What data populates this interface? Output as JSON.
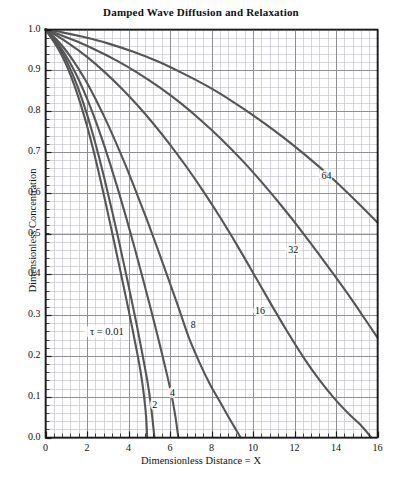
{
  "chart_data": {
    "type": "line",
    "title": "Damped Wave Diffusion and Relaxation",
    "xlabel": "Dimensionless Distance = X",
    "ylabel": "Dimensionless Concentration",
    "xlim": [
      0,
      16
    ],
    "ylim": [
      0,
      1.0
    ],
    "xticks": [
      0,
      2,
      4,
      6,
      8,
      10,
      12,
      14,
      16
    ],
    "xticklabels": [
      "0",
      "2",
      "4",
      "6",
      "8",
      "10",
      "12",
      "14",
      "16"
    ],
    "yticks": [
      0.0,
      0.1,
      0.2,
      0.3,
      0.4,
      0.5,
      0.6,
      0.7,
      0.8,
      0.9,
      1.0
    ],
    "yticklabels": [
      "0.0",
      "0.1",
      "0.2",
      "0.3",
      "0.4",
      "0.5",
      "0.6",
      "0.7",
      "0.8",
      "0.9",
      "1.0"
    ],
    "grid": true,
    "grid_minor_x_step": 0.4,
    "grid_minor_y_step": 0.02,
    "legend_position": "inline-curve-labels",
    "curve_color": "#555555",
    "grid_color": "#8f8f96",
    "minor_grid_color": "#c3c3cb",
    "frame_color": "#1a1a1a",
    "series": [
      {
        "name": "tau = 0.01",
        "label": "τ = 0.01",
        "label_x": 1.9,
        "label_y": 0.255,
        "points": [
          [
            0.0,
            1.0
          ],
          [
            0.2,
            0.985
          ],
          [
            0.5,
            0.962
          ],
          [
            0.8,
            0.935
          ],
          [
            1.1,
            0.902
          ],
          [
            1.4,
            0.862
          ],
          [
            1.7,
            0.816
          ],
          [
            2.0,
            0.764
          ],
          [
            2.3,
            0.706
          ],
          [
            2.6,
            0.642
          ],
          [
            2.9,
            0.575
          ],
          [
            3.2,
            0.505
          ],
          [
            3.5,
            0.434
          ],
          [
            3.8,
            0.362
          ],
          [
            4.1,
            0.289
          ],
          [
            4.4,
            0.212
          ],
          [
            4.6,
            0.156
          ],
          [
            4.75,
            0.1
          ],
          [
            4.85,
            0.05
          ],
          [
            4.9,
            0.0
          ]
        ]
      },
      {
        "name": "tau = 2",
        "label": "2",
        "label_x": 5.05,
        "label_y": 0.075,
        "points": [
          [
            0.0,
            1.0
          ],
          [
            0.2,
            0.987
          ],
          [
            0.5,
            0.967
          ],
          [
            0.8,
            0.943
          ],
          [
            1.1,
            0.914
          ],
          [
            1.4,
            0.879
          ],
          [
            1.7,
            0.838
          ],
          [
            2.0,
            0.792
          ],
          [
            2.3,
            0.74
          ],
          [
            2.6,
            0.683
          ],
          [
            2.9,
            0.622
          ],
          [
            3.2,
            0.557
          ],
          [
            3.5,
            0.49
          ],
          [
            3.8,
            0.42
          ],
          [
            4.1,
            0.349
          ],
          [
            4.4,
            0.275
          ],
          [
            4.7,
            0.196
          ],
          [
            4.95,
            0.126
          ],
          [
            5.1,
            0.07
          ],
          [
            5.25,
            0.0
          ]
        ]
      },
      {
        "name": "tau = 4",
        "label": "4",
        "label_x": 5.9,
        "label_y": 0.105,
        "points": [
          [
            0.0,
            1.0
          ],
          [
            0.3,
            0.984
          ],
          [
            0.7,
            0.958
          ],
          [
            1.1,
            0.926
          ],
          [
            1.5,
            0.888
          ],
          [
            1.9,
            0.843
          ],
          [
            2.3,
            0.792
          ],
          [
            2.7,
            0.735
          ],
          [
            3.1,
            0.673
          ],
          [
            3.5,
            0.607
          ],
          [
            3.9,
            0.537
          ],
          [
            4.3,
            0.464
          ],
          [
            4.7,
            0.388
          ],
          [
            5.1,
            0.31
          ],
          [
            5.5,
            0.229
          ],
          [
            5.8,
            0.166
          ],
          [
            6.05,
            0.11
          ],
          [
            6.25,
            0.055
          ],
          [
            6.4,
            0.0
          ]
        ]
      },
      {
        "name": "tau = 8",
        "label": "8",
        "label_x": 6.9,
        "label_y": 0.272,
        "points": [
          [
            0.0,
            1.0
          ],
          [
            0.4,
            0.982
          ],
          [
            0.9,
            0.954
          ],
          [
            1.4,
            0.919
          ],
          [
            1.9,
            0.878
          ],
          [
            2.4,
            0.831
          ],
          [
            2.9,
            0.779
          ],
          [
            3.4,
            0.722
          ],
          [
            3.9,
            0.662
          ],
          [
            4.4,
            0.598
          ],
          [
            4.9,
            0.532
          ],
          [
            5.4,
            0.463
          ],
          [
            5.9,
            0.392
          ],
          [
            6.4,
            0.32
          ],
          [
            6.9,
            0.246
          ],
          [
            7.4,
            0.186
          ],
          [
            7.9,
            0.133
          ],
          [
            8.4,
            0.088
          ],
          [
            8.8,
            0.052
          ],
          [
            9.1,
            0.026
          ],
          [
            9.4,
            0.0
          ]
        ]
      },
      {
        "name": "tau = 16",
        "label": "16",
        "label_x": 10.0,
        "label_y": 0.305,
        "points": [
          [
            0.0,
            1.0
          ],
          [
            0.5,
            0.986
          ],
          [
            1.2,
            0.963
          ],
          [
            2.0,
            0.933
          ],
          [
            2.8,
            0.898
          ],
          [
            3.6,
            0.859
          ],
          [
            4.4,
            0.816
          ],
          [
            5.2,
            0.769
          ],
          [
            6.0,
            0.718
          ],
          [
            6.8,
            0.663
          ],
          [
            7.6,
            0.604
          ],
          [
            8.4,
            0.541
          ],
          [
            9.2,
            0.474
          ],
          [
            10.0,
            0.404
          ],
          [
            10.8,
            0.333
          ],
          [
            11.6,
            0.264
          ],
          [
            12.4,
            0.199
          ],
          [
            13.2,
            0.141
          ],
          [
            14.0,
            0.091
          ],
          [
            14.7,
            0.054
          ],
          [
            15.2,
            0.03
          ],
          [
            15.7,
            0.0
          ]
        ]
      },
      {
        "name": "tau = 32",
        "label": "32",
        "label_x": 11.6,
        "label_y": 0.455,
        "points": [
          [
            0.0,
            1.0
          ],
          [
            0.6,
            0.989
          ],
          [
            1.5,
            0.971
          ],
          [
            2.5,
            0.948
          ],
          [
            3.5,
            0.922
          ],
          [
            4.5,
            0.892
          ],
          [
            5.5,
            0.858
          ],
          [
            6.5,
            0.82
          ],
          [
            7.5,
            0.777
          ],
          [
            8.5,
            0.73
          ],
          [
            9.5,
            0.678
          ],
          [
            10.5,
            0.621
          ],
          [
            11.5,
            0.56
          ],
          [
            12.5,
            0.495
          ],
          [
            13.5,
            0.427
          ],
          [
            14.5,
            0.357
          ],
          [
            15.2,
            0.305
          ],
          [
            16.0,
            0.245
          ]
        ]
      },
      {
        "name": "tau = 64",
        "label": "64",
        "label_x": 13.2,
        "label_y": 0.635,
        "points": [
          [
            0.0,
            1.0
          ],
          [
            0.8,
            0.993
          ],
          [
            1.8,
            0.982
          ],
          [
            3.0,
            0.966
          ],
          [
            4.2,
            0.946
          ],
          [
            5.4,
            0.922
          ],
          [
            6.6,
            0.893
          ],
          [
            7.8,
            0.861
          ],
          [
            9.0,
            0.824
          ],
          [
            10.2,
            0.783
          ],
          [
            11.4,
            0.738
          ],
          [
            12.6,
            0.689
          ],
          [
            13.8,
            0.636
          ],
          [
            15.0,
            0.578
          ],
          [
            16.0,
            0.527
          ]
        ]
      }
    ]
  }
}
